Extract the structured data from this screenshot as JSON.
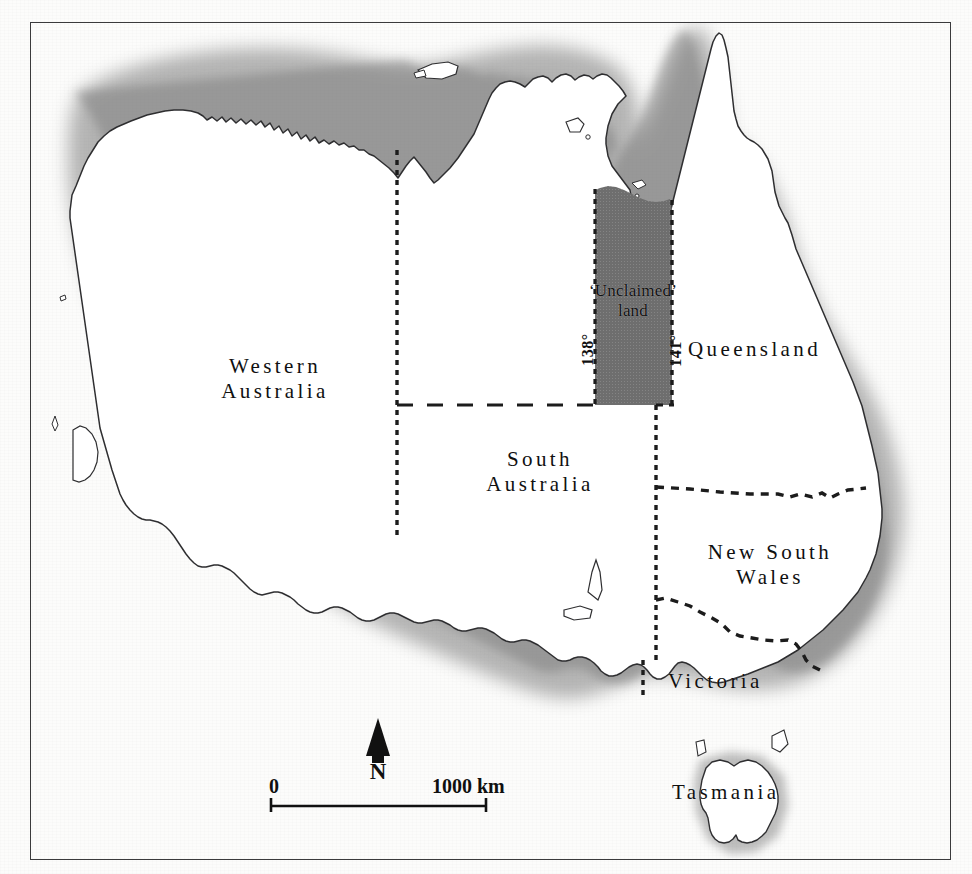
{
  "map": {
    "title": "Map of Australia showing states and the 'Unclaimed' land strip",
    "region": "Australia",
    "frame": {
      "border_color": "#3a3a3c"
    },
    "land_fill": "#ffffff",
    "ocean_halo_color": "#8a8a8a",
    "unclaimed_fill": "#6e6e6e",
    "state_labels": [
      {
        "id": "western-australia",
        "line1": "Western",
        "line2": "Australia"
      },
      {
        "id": "south-australia",
        "line1": "South",
        "line2": "Australia"
      },
      {
        "id": "queensland",
        "line1": "Queensland",
        "line2": ""
      },
      {
        "id": "new-south-wales",
        "line1": "New South",
        "line2": "Wales"
      },
      {
        "id": "victoria",
        "line1": "Victoria",
        "line2": ""
      },
      {
        "id": "tasmania",
        "line1": "Tasmania",
        "line2": ""
      }
    ],
    "unclaimed": {
      "line1": "‘Unclaimed’",
      "line2": "land",
      "west_meridian": "138°",
      "east_meridian": "141°"
    },
    "compass": {
      "label": "N"
    },
    "scale_bar": {
      "start_label": "0",
      "end_label": "1000 km"
    },
    "caption": ""
  }
}
